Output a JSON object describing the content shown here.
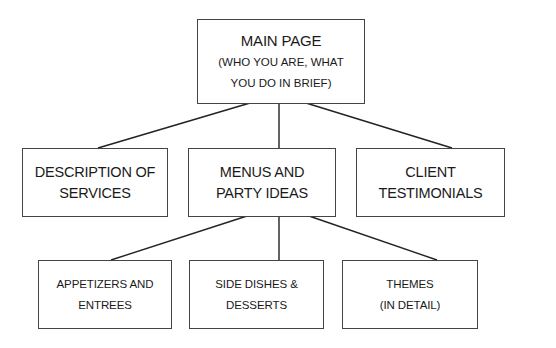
{
  "diagram": {
    "type": "sitemap-tree",
    "root": {
      "id": "main",
      "lines": [
        "MAIN PAGE",
        "(WHO YOU ARE, WHAT",
        "YOU DO IN BRIEF)"
      ]
    },
    "level2": [
      {
        "id": "services",
        "lines": [
          "DESCRIPTION OF",
          "SERVICES"
        ]
      },
      {
        "id": "menus",
        "lines": [
          "MENUS AND",
          "PARTY IDEAS"
        ]
      },
      {
        "id": "testimonials",
        "lines": [
          "CLIENT",
          "TESTIMONIALS"
        ]
      }
    ],
    "level3": [
      {
        "id": "appetizers",
        "parent": "menus",
        "lines": [
          "APPETIZERS AND",
          "ENTREES"
        ]
      },
      {
        "id": "sides",
        "parent": "menus",
        "lines": [
          "SIDE DISHES &",
          "DESSERTS"
        ]
      },
      {
        "id": "themes",
        "parent": "menus",
        "lines": [
          "THEMES",
          "(IN DETAIL)"
        ]
      }
    ],
    "edges": [
      [
        "main",
        "services"
      ],
      [
        "main",
        "menus"
      ],
      [
        "main",
        "testimonials"
      ],
      [
        "menus",
        "appetizers"
      ],
      [
        "menus",
        "sides"
      ],
      [
        "menus",
        "themes"
      ]
    ],
    "colors": {
      "line": "#222222",
      "border": "#444444",
      "background": "#ffffff"
    }
  }
}
